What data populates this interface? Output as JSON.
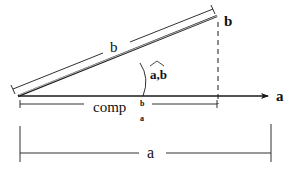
{
  "diagram": {
    "colors": {
      "stroke": "#1a1a1a",
      "background": "#ffffff"
    },
    "vectors": {
      "a": {
        "label": "a",
        "from": [
          18,
          96
        ],
        "to": [
          270,
          96
        ]
      },
      "b": {
        "label": "b",
        "from": [
          18,
          96
        ],
        "to": [
          217,
          16
        ]
      }
    },
    "labels": {
      "b_tip": "b",
      "a_tip": "a",
      "b_length": "b",
      "angle": "a,b",
      "comp_base": "comp",
      "comp_sup": "b",
      "comp_sub": "a",
      "a_length": "a"
    },
    "projection": {
      "dashed_x": 218,
      "from_y": 20,
      "to_y": 104
    },
    "dimensions": {
      "comp": {
        "x1": 20,
        "x2": 217,
        "y": 104
      },
      "a_length": {
        "x1": 20,
        "x2": 271,
        "y": 153
      }
    }
  }
}
